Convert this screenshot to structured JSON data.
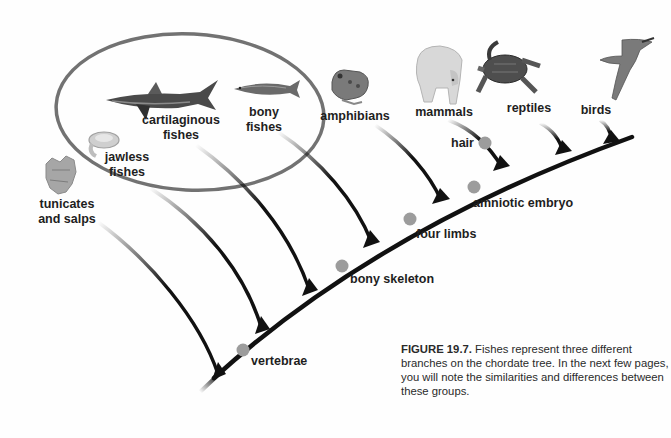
{
  "figure": {
    "number": "FIGURE 19.7.",
    "caption": " Fishes represent three different branches on the chordate tree.  In the next few pages, you will note the similarities and differences between these groups."
  },
  "taxa": [
    {
      "id": "tunicates",
      "line1": "tunicates",
      "line2": "and salps",
      "icon": "tunicate-icon"
    },
    {
      "id": "jawless",
      "line1": "jawless",
      "line2": "fishes",
      "icon": "lamprey-icon"
    },
    {
      "id": "cartilaginous",
      "line1": "cartilaginous",
      "line2": "fishes",
      "icon": "shark-icon"
    },
    {
      "id": "bony",
      "line1": "bony",
      "line2": "fishes",
      "icon": "fish-icon"
    },
    {
      "id": "amphibians",
      "line1": "amphibians",
      "icon": "frog-icon"
    },
    {
      "id": "mammals",
      "line1": "mammals",
      "icon": "polar-bear-icon"
    },
    {
      "id": "reptiles",
      "line1": "reptiles",
      "icon": "turtle-icon"
    },
    {
      "id": "birds",
      "line1": "birds",
      "icon": "bird-icon"
    }
  ],
  "traits": [
    {
      "id": "vertebrae",
      "label": "vertebrae"
    },
    {
      "id": "bony-skeleton",
      "label": "bony skeleton"
    },
    {
      "id": "four-limbs",
      "label": "four limbs"
    },
    {
      "id": "amniotic-embryo",
      "label": "amniotic embryo"
    },
    {
      "id": "hair",
      "label": "hair"
    }
  ],
  "highlight": {
    "group": "fishes",
    "shape": "ellipse",
    "color": "#707070"
  },
  "colors": {
    "branch": "#111111",
    "trait_dot": "#9a9a9a",
    "ellipse": "#6e6e6e",
    "text": "#1e1e1e"
  }
}
